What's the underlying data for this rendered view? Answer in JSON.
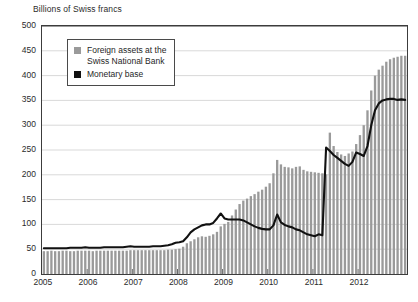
{
  "chart_data": {
    "type": "bar",
    "title": "Billions of Swiss francs",
    "xlabel": "",
    "ylabel": "Billions of Swiss francs",
    "ylim": [
      0,
      500
    ],
    "ytick_labels": [
      "0",
      "50",
      "100",
      "150",
      "200",
      "250",
      "300",
      "350",
      "400",
      "450",
      "500"
    ],
    "ytick_values": [
      0,
      50,
      100,
      150,
      200,
      250,
      300,
      350,
      400,
      450,
      500
    ],
    "xtick_labels": [
      "2005",
      "2006",
      "2007",
      "2008",
      "2009",
      "2010",
      "2011",
      "2012"
    ],
    "xtick_values": [
      2005,
      2006,
      2007,
      2008,
      2009,
      2010,
      2011,
      2012
    ],
    "grid": true,
    "legend_position": "upper-left-inside",
    "x_start": 2005.0,
    "x_step_months": 1,
    "series": [
      {
        "name": "Foreign assets at the\nSwiss National Bank",
        "render": "bar",
        "color": "#9a9a9a",
        "values": [
          46,
          46,
          47,
          46,
          46,
          47,
          47,
          46,
          46,
          47,
          47,
          47,
          47,
          46,
          47,
          47,
          47,
          47,
          47,
          47,
          47,
          47,
          47,
          48,
          48,
          48,
          48,
          48,
          48,
          48,
          48,
          48,
          48,
          49,
          49,
          50,
          51,
          55,
          62,
          66,
          70,
          74,
          76,
          75,
          77,
          80,
          85,
          96,
          101,
          105,
          118,
          130,
          141,
          148,
          152,
          157,
          161,
          166,
          170,
          176,
          183,
          203,
          230,
          221,
          216,
          215,
          213,
          216,
          217,
          210,
          207,
          206,
          205,
          204,
          203,
          201,
          285,
          258,
          246,
          241,
          238,
          243,
          247,
          262,
          280,
          300,
          330,
          370,
          400,
          412,
          420,
          428,
          433,
          436,
          438,
          440,
          440
        ]
      },
      {
        "name": "Monetary base",
        "render": "line",
        "color": "#111111",
        "values": [
          52,
          52,
          52,
          52,
          52,
          52,
          52,
          53,
          53,
          53,
          53,
          54,
          53,
          53,
          53,
          53,
          54,
          54,
          54,
          54,
          54,
          54,
          55,
          56,
          55,
          55,
          55,
          55,
          55,
          56,
          56,
          56,
          57,
          58,
          60,
          63,
          64,
          66,
          74,
          84,
          90,
          94,
          98,
          100,
          100,
          103,
          112,
          122,
          112,
          110,
          110,
          110,
          110,
          108,
          104,
          100,
          96,
          93,
          91,
          90,
          90,
          98,
          120,
          104,
          99,
          96,
          94,
          90,
          88,
          84,
          80,
          78,
          76,
          80,
          78,
          255,
          248,
          240,
          234,
          228,
          222,
          218,
          226,
          245,
          242,
          238,
          258,
          300,
          330,
          344,
          350,
          352,
          353,
          353,
          351,
          352,
          351
        ]
      }
    ]
  },
  "legend": {
    "items": [
      {
        "label": "Foreign assets at the\nSwiss National Bank",
        "color": "#9a9a9a"
      },
      {
        "label": "Monetary base",
        "color": "#111111"
      }
    ]
  }
}
